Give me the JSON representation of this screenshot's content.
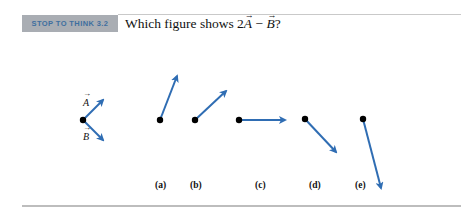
{
  "header": {
    "badge": "STOP TO THINK 3.2",
    "question_prefix": "Which figure shows 2",
    "vector_a": "A",
    "minus": " − ",
    "vector_b": "B",
    "question_suffix": "?"
  },
  "given": {
    "label_a": "A",
    "label_b": "B"
  },
  "options": [
    {
      "label": "(a)"
    },
    {
      "label": "(b)"
    },
    {
      "label": "(c)"
    },
    {
      "label": "(d)"
    },
    {
      "label": "(e)"
    }
  ],
  "colors": {
    "arrow": "#2f6db3",
    "badge_bg": "#a9adb3",
    "badge_text": "#3f6f9f"
  }
}
